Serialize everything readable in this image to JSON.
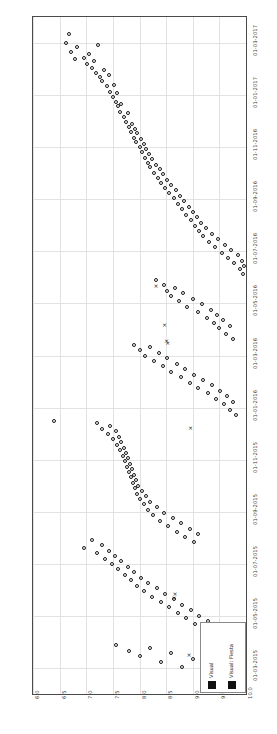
{
  "chart_data": {
    "type": "scatter",
    "title": "",
    "subtitle": "",
    "xlabel": "",
    "ylabel": "",
    "orientation": "rotated-90",
    "grid": true,
    "legend_position": "bottom-right",
    "value_axis": {
      "position": "bottom",
      "ticks": [
        "6.0",
        "6.5",
        "7.0",
        "7.5",
        "8.0",
        "8.5",
        "9.0",
        "9.5",
        "10.0"
      ],
      "lim": [
        6.0,
        10.0
      ]
    },
    "date_axis": {
      "position": "right",
      "ticks": [
        "01-03-2015",
        "01-05-2015",
        "01-07-2015",
        "01-09-2015",
        "01-11-2015",
        "01-01-2016",
        "01-03-2016",
        "01-05-2016",
        "01-07-2016",
        "01-09-2016",
        "01-11-2016",
        "01-01-2017",
        "01-03-2017"
      ],
      "lim": [
        "01-02-2015",
        "01-04-2017"
      ]
    },
    "series": [
      {
        "name": "Visual",
        "marker": "o",
        "color": "#1a1a1a",
        "points": [
          [
            6.62,
            0.962
          ],
          [
            6.72,
            0.948
          ],
          [
            6.79,
            0.938
          ],
          [
            6.83,
            0.956
          ],
          [
            6.95,
            0.94
          ],
          [
            7.02,
            0.93
          ],
          [
            7.05,
            0.945
          ],
          [
            7.1,
            0.925
          ],
          [
            7.14,
            0.935
          ],
          [
            7.18,
            0.918
          ],
          [
            6.68,
            0.975
          ],
          [
            7.22,
            0.958
          ],
          [
            7.26,
            0.912
          ],
          [
            7.3,
            0.905
          ],
          [
            7.33,
            0.922
          ],
          [
            7.38,
            0.898
          ],
          [
            7.42,
            0.915
          ],
          [
            7.45,
            0.89
          ],
          [
            7.5,
            0.882
          ],
          [
            7.52,
            0.9
          ],
          [
            7.56,
            0.875
          ],
          [
            7.58,
            0.888
          ],
          [
            7.6,
            0.868
          ],
          [
            7.64,
            0.86
          ],
          [
            7.66,
            0.872
          ],
          [
            7.7,
            0.852
          ],
          [
            7.74,
            0.845
          ],
          [
            7.78,
            0.858
          ],
          [
            7.8,
            0.838
          ],
          [
            7.84,
            0.83
          ],
          [
            7.86,
            0.842
          ],
          [
            7.9,
            0.822
          ],
          [
            7.92,
            0.835
          ],
          [
            7.94,
            0.815
          ],
          [
            7.96,
            0.828
          ],
          [
            8.0,
            0.808
          ],
          [
            8.02,
            0.82
          ],
          [
            8.05,
            0.8
          ],
          [
            8.08,
            0.812
          ],
          [
            8.1,
            0.792
          ],
          [
            8.12,
            0.805
          ],
          [
            8.16,
            0.785
          ],
          [
            8.18,
            0.798
          ],
          [
            8.2,
            0.778
          ],
          [
            8.24,
            0.79
          ],
          [
            8.28,
            0.77
          ],
          [
            8.3,
            0.782
          ],
          [
            8.34,
            0.762
          ],
          [
            8.38,
            0.775
          ],
          [
            8.4,
            0.755
          ],
          [
            8.44,
            0.768
          ],
          [
            8.48,
            0.748
          ],
          [
            8.52,
            0.76
          ],
          [
            8.56,
            0.74
          ],
          [
            8.6,
            0.752
          ],
          [
            8.64,
            0.732
          ],
          [
            8.68,
            0.744
          ],
          [
            8.72,
            0.724
          ],
          [
            8.76,
            0.736
          ],
          [
            8.8,
            0.716
          ],
          [
            8.84,
            0.728
          ],
          [
            8.88,
            0.708
          ],
          [
            8.92,
            0.72
          ],
          [
            8.96,
            0.7
          ],
          [
            9.0,
            0.712
          ],
          [
            9.04,
            0.692
          ],
          [
            9.08,
            0.704
          ],
          [
            9.12,
            0.684
          ],
          [
            9.16,
            0.696
          ],
          [
            9.2,
            0.676
          ],
          [
            9.24,
            0.688
          ],
          [
            9.3,
            0.668
          ],
          [
            9.36,
            0.68
          ],
          [
            9.42,
            0.66
          ],
          [
            9.48,
            0.672
          ],
          [
            9.54,
            0.652
          ],
          [
            9.6,
            0.664
          ],
          [
            9.66,
            0.644
          ],
          [
            9.72,
            0.656
          ],
          [
            9.78,
            0.636
          ],
          [
            9.84,
            0.648
          ],
          [
            9.88,
            0.628
          ],
          [
            9.92,
            0.64
          ],
          [
            9.95,
            0.62
          ],
          [
            9.97,
            0.632
          ],
          [
            8.3,
            0.612
          ],
          [
            8.46,
            0.604
          ],
          [
            8.52,
            0.596
          ],
          [
            8.6,
            0.588
          ],
          [
            8.66,
            0.6
          ],
          [
            8.74,
            0.58
          ],
          [
            8.82,
            0.592
          ],
          [
            8.9,
            0.572
          ],
          [
            9.0,
            0.584
          ],
          [
            9.1,
            0.564
          ],
          [
            9.18,
            0.576
          ],
          [
            9.26,
            0.556
          ],
          [
            9.34,
            0.568
          ],
          [
            9.4,
            0.548
          ],
          [
            9.46,
            0.56
          ],
          [
            9.5,
            0.54
          ],
          [
            9.56,
            0.552
          ],
          [
            9.62,
            0.532
          ],
          [
            9.7,
            0.544
          ],
          [
            9.76,
            0.524
          ],
          [
            7.9,
            0.516
          ],
          [
            8.0,
            0.508
          ],
          [
            8.1,
            0.5
          ],
          [
            8.2,
            0.512
          ],
          [
            8.28,
            0.492
          ],
          [
            8.36,
            0.504
          ],
          [
            8.44,
            0.484
          ],
          [
            8.52,
            0.496
          ],
          [
            8.6,
            0.476
          ],
          [
            8.7,
            0.488
          ],
          [
            8.78,
            0.468
          ],
          [
            8.86,
            0.48
          ],
          [
            8.94,
            0.46
          ],
          [
            9.02,
            0.472
          ],
          [
            9.1,
            0.452
          ],
          [
            9.2,
            0.464
          ],
          [
            9.28,
            0.444
          ],
          [
            9.36,
            0.456
          ],
          [
            9.44,
            0.436
          ],
          [
            9.52,
            0.448
          ],
          [
            9.58,
            0.428
          ],
          [
            9.64,
            0.44
          ],
          [
            9.7,
            0.42
          ],
          [
            9.76,
            0.432
          ],
          [
            9.82,
            0.412
          ],
          [
            6.4,
            0.404
          ],
          [
            7.2,
            0.4
          ],
          [
            7.3,
            0.392
          ],
          [
            7.4,
            0.384
          ],
          [
            7.45,
            0.396
          ],
          [
            7.5,
            0.376
          ],
          [
            7.55,
            0.388
          ],
          [
            7.58,
            0.368
          ],
          [
            7.62,
            0.38
          ],
          [
            7.64,
            0.36
          ],
          [
            7.66,
            0.372
          ],
          [
            7.68,
            0.352
          ],
          [
            7.7,
            0.364
          ],
          [
            7.72,
            0.344
          ],
          [
            7.74,
            0.356
          ],
          [
            7.76,
            0.336
          ],
          [
            7.78,
            0.348
          ],
          [
            7.8,
            0.328
          ],
          [
            7.82,
            0.34
          ],
          [
            7.84,
            0.32
          ],
          [
            7.86,
            0.332
          ],
          [
            7.88,
            0.312
          ],
          [
            7.9,
            0.324
          ],
          [
            7.92,
            0.304
          ],
          [
            7.94,
            0.316
          ],
          [
            7.96,
            0.296
          ],
          [
            7.98,
            0.308
          ],
          [
            8.0,
            0.288
          ],
          [
            8.04,
            0.3
          ],
          [
            8.08,
            0.28
          ],
          [
            8.12,
            0.292
          ],
          [
            8.16,
            0.272
          ],
          [
            8.2,
            0.284
          ],
          [
            8.26,
            0.264
          ],
          [
            8.32,
            0.276
          ],
          [
            8.38,
            0.256
          ],
          [
            8.46,
            0.268
          ],
          [
            8.54,
            0.248
          ],
          [
            8.62,
            0.26
          ],
          [
            8.7,
            0.24
          ],
          [
            8.78,
            0.252
          ],
          [
            8.86,
            0.232
          ],
          [
            8.94,
            0.244
          ],
          [
            9.02,
            0.224
          ],
          [
            9.1,
            0.236
          ],
          [
            6.95,
            0.216
          ],
          [
            7.1,
            0.228
          ],
          [
            7.2,
            0.208
          ],
          [
            7.3,
            0.22
          ],
          [
            7.36,
            0.2
          ],
          [
            7.42,
            0.212
          ],
          [
            7.48,
            0.192
          ],
          [
            7.54,
            0.204
          ],
          [
            7.6,
            0.184
          ],
          [
            7.66,
            0.196
          ],
          [
            7.72,
            0.176
          ],
          [
            7.78,
            0.188
          ],
          [
            7.84,
            0.168
          ],
          [
            7.9,
            0.18
          ],
          [
            7.96,
            0.16
          ],
          [
            8.02,
            0.172
          ],
          [
            8.08,
            0.152
          ],
          [
            8.16,
            0.164
          ],
          [
            8.24,
            0.144
          ],
          [
            8.32,
            0.156
          ],
          [
            8.4,
            0.136
          ],
          [
            8.48,
            0.148
          ],
          [
            8.56,
            0.128
          ],
          [
            8.64,
            0.14
          ],
          [
            8.72,
            0.12
          ],
          [
            8.8,
            0.132
          ],
          [
            8.88,
            0.112
          ],
          [
            8.96,
            0.124
          ],
          [
            9.04,
            0.104
          ],
          [
            9.12,
            0.116
          ],
          [
            9.2,
            0.096
          ],
          [
            9.28,
            0.108
          ],
          [
            9.36,
            0.088
          ],
          [
            9.44,
            0.1
          ],
          [
            9.52,
            0.08
          ],
          [
            7.55,
            0.072
          ],
          [
            7.8,
            0.064
          ],
          [
            8.0,
            0.056
          ],
          [
            8.2,
            0.068
          ],
          [
            8.4,
            0.048
          ],
          [
            8.6,
            0.06
          ],
          [
            8.8,
            0.04
          ],
          [
            9.0,
            0.052
          ],
          [
            9.2,
            0.032
          ],
          [
            9.4,
            0.044
          ],
          [
            9.6,
            0.024
          ],
          [
            9.7,
            0.036
          ],
          [
            9.8,
            0.016
          ],
          [
            9.88,
            0.028
          ],
          [
            9.94,
            0.01
          ]
        ]
      },
      {
        "name": "Visual: Fiesta",
        "marker": "x",
        "color": "#1a1a1a",
        "points": [
          [
            8.46,
            0.545
          ],
          [
            8.5,
            0.522
          ],
          [
            8.52,
            0.518
          ],
          [
            8.95,
            0.393
          ],
          [
            8.66,
            0.148
          ],
          [
            8.64,
            0.142
          ],
          [
            9.2,
            0.063
          ],
          [
            8.92,
            0.058
          ],
          [
            8.3,
            0.602
          ]
        ]
      }
    ]
  },
  "legend": {
    "entries": [
      {
        "label": "Visual",
        "marker": "square",
        "color": "#111111"
      },
      {
        "label": "Visual: Fiesta",
        "marker": "square",
        "color": "#111111"
      }
    ]
  }
}
